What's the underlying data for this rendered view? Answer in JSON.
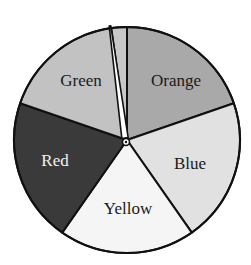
{
  "chart_data": {
    "type": "pie",
    "title": "",
    "center": [
      127,
      140
    ],
    "radius": 113,
    "start_angle_deg": 0,
    "direction": "clockwise",
    "slices": [
      {
        "label": "Orange",
        "degrees": 71,
        "percent": 19.7,
        "color": "#a9a9a9",
        "text_color": "#1a1a1a",
        "label_pos": [
          176,
          82
        ]
      },
      {
        "label": "Blue",
        "degrees": 74,
        "percent": 20.6,
        "color": "#e1e1e1",
        "text_color": "#1a1a1a",
        "label_pos": [
          190,
          165
        ]
      },
      {
        "label": "Yellow",
        "degrees": 70,
        "percent": 19.4,
        "color": "#f5f5f5",
        "text_color": "#1a1a1a",
        "label_pos": [
          128,
          210
        ]
      },
      {
        "label": "Red",
        "degrees": 74,
        "percent": 20.6,
        "color": "#3a3a3a",
        "text_color": "#f0f0f0",
        "label_pos": [
          55,
          162
        ]
      },
      {
        "label": "Green",
        "degrees": 63,
        "percent": 17.5,
        "color": "#c2c2c2",
        "text_color": "#1a1a1a",
        "label_pos": [
          81,
          82
        ]
      },
      {
        "label": "",
        "degrees": 8,
        "percent": 2.2,
        "color": "#c8c8c8",
        "text_color": "#1a1a1a",
        "label_pos": null
      }
    ],
    "pointer": {
      "type": "spinner-needle",
      "tip": [
        110,
        26
      ],
      "base": [
        125,
        138
      ],
      "hub": [
        126,
        142
      ],
      "fill": "#ffffff",
      "stroke": "#111111"
    },
    "legend": null,
    "annotations": []
  }
}
